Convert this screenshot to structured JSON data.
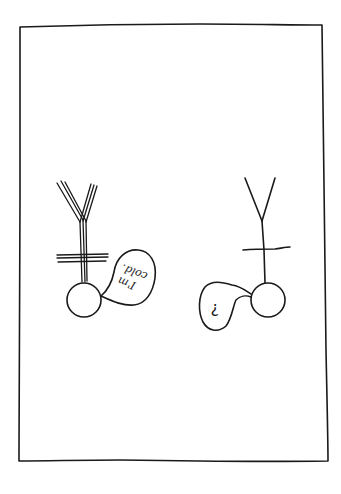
{
  "drawing": {
    "style": "hand-drawn ink on white paper",
    "colors": {
      "background": "#ffffff",
      "ink": "#1a1a1a"
    },
    "frame": {
      "shape": "hand-drawn rectangle border"
    },
    "figures": [
      {
        "id": "left-figure",
        "description": "Shivering stick figure drawn with doubled lines, upside down",
        "line_style": "doubled",
        "speech_bubble": {
          "line1": "I'm",
          "line2": "cold.",
          "orientation": "upside-down"
        }
      },
      {
        "id": "right-figure",
        "description": "Stick figure drawn with single lines, upside down",
        "line_style": "single",
        "speech_bubble": {
          "text": "?",
          "orientation": "upside-down"
        }
      }
    ]
  }
}
